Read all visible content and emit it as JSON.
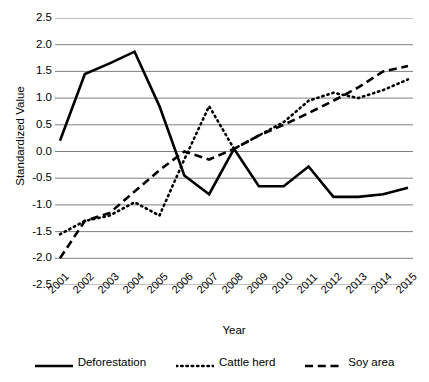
{
  "chart_data": {
    "type": "line",
    "title": "",
    "xlabel": "Year",
    "ylabel": "Standardized Value",
    "categories": [
      "2001",
      "2002",
      "2003",
      "2004",
      "2005",
      "2006",
      "2007",
      "2008",
      "2009",
      "2010",
      "2011",
      "2012",
      "2013",
      "2014",
      "2015"
    ],
    "x": [
      2001,
      2002,
      2003,
      2004,
      2005,
      2006,
      2007,
      2008,
      2009,
      2010,
      2011,
      2012,
      2013,
      2014,
      2015
    ],
    "ylim": [
      -2.5,
      2.5
    ],
    "ytick_labels": [
      "2.5",
      "2.0",
      "1.5",
      "1.0",
      "0.5",
      "0.0",
      "-0.5",
      "-1.0",
      "-1.5",
      "-2.0",
      "-2.5"
    ],
    "yticks": [
      2.5,
      2.0,
      1.5,
      1.0,
      0.5,
      0.0,
      -0.5,
      -1.0,
      -1.5,
      -2.0,
      -2.5
    ],
    "grid": true,
    "grid_axis": "y",
    "grid_color": "#808080",
    "legend_position": "bottom",
    "series": [
      {
        "name": "Deforestation",
        "style": "solid",
        "color": "#000000",
        "width": 2.6,
        "values": [
          0.2,
          1.45,
          1.65,
          1.87,
          0.85,
          -0.45,
          -0.8,
          0.05,
          -0.65,
          -0.65,
          -0.28,
          -0.85,
          -0.85,
          -0.8,
          -0.68
        ]
      },
      {
        "name": "Cattle herd",
        "style": "dotted",
        "color": "#000000",
        "width": 2.6,
        "values": [
          -1.55,
          -1.3,
          -1.2,
          -0.95,
          -1.2,
          -0.15,
          0.85,
          0.05,
          0.3,
          0.55,
          0.95,
          1.1,
          1.0,
          1.15,
          1.35
        ]
      },
      {
        "name": "Soy area",
        "style": "dashed",
        "color": "#000000",
        "width": 2.6,
        "values": [
          -2.0,
          -1.3,
          -1.15,
          -0.75,
          -0.35,
          0.0,
          -0.15,
          0.05,
          0.3,
          0.5,
          0.72,
          0.95,
          1.2,
          1.5,
          1.6
        ]
      }
    ]
  },
  "axes": {
    "y_title": "Standardized Value",
    "x_title": "Year"
  },
  "legend": {
    "items": [
      {
        "label": "Deforestation",
        "style": "solid"
      },
      {
        "label": "Cattle herd",
        "style": "dotted"
      },
      {
        "label": "Soy area",
        "style": "dashed"
      }
    ]
  }
}
